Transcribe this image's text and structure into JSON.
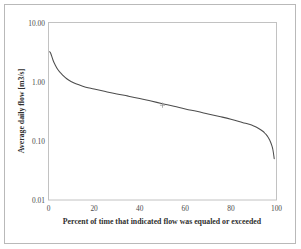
{
  "chart_data": {
    "type": "line",
    "title": "",
    "xlabel": "Percent of time that indicated flow was equaled or exceeded",
    "ylabel": "Average daily flow [m3/s]",
    "xlim": [
      0,
      100
    ],
    "ylim": [
      0.01,
      10.0
    ],
    "yscale": "log",
    "xscale": "linear",
    "grid": false,
    "legend": null,
    "xticks": [
      0,
      20,
      40,
      60,
      80,
      100
    ],
    "xtick_labels": [
      "0",
      "20",
      "40",
      "60",
      "80",
      "100"
    ],
    "yticks": [
      0.01,
      0.1,
      1.0,
      10.0
    ],
    "ytick_labels": [
      "0.01",
      "0.10",
      "1.00",
      "10.00"
    ],
    "series": [
      {
        "name": "Flow duration curve",
        "x": [
          0.5,
          1,
          2,
          3,
          4,
          5,
          6,
          8,
          10,
          12,
          15,
          18,
          20,
          25,
          30,
          35,
          40,
          45,
          50,
          55,
          60,
          65,
          70,
          75,
          80,
          85,
          88,
          90,
          92,
          94,
          95,
          96,
          97,
          98,
          98.5,
          99
        ],
        "y": [
          3.2,
          3.0,
          2.3,
          1.9,
          1.62,
          1.45,
          1.32,
          1.12,
          1.0,
          0.92,
          0.84,
          0.78,
          0.75,
          0.68,
          0.62,
          0.57,
          0.52,
          0.47,
          0.425,
          0.385,
          0.345,
          0.315,
          0.285,
          0.258,
          0.232,
          0.205,
          0.19,
          0.178,
          0.163,
          0.145,
          0.133,
          0.12,
          0.103,
          0.082,
          0.068,
          0.05
        ]
      }
    ],
    "annotations": [
      {
        "name": "mid-point-marker",
        "symbol": "cross",
        "x": 50,
        "y": 0.4
      }
    ]
  },
  "axis": {
    "x_title": "Percent of time that indicated flow was equaled or exceeded",
    "y_title": "Average daily flow [m3/s]"
  }
}
